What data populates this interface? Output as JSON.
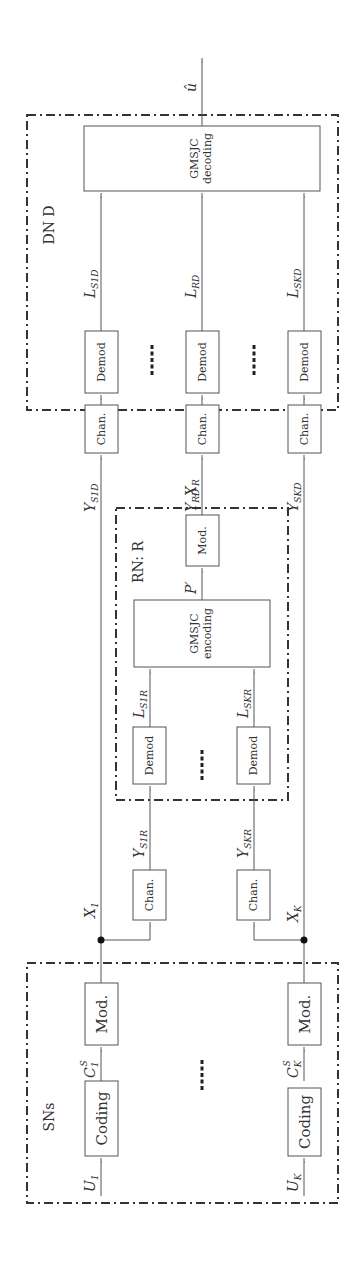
{
  "figure": {
    "orientation": "rotated 90 degrees counter-clockwise",
    "colors": {
      "line": "#555555",
      "group_border": "#333333",
      "text": "#333333",
      "background": "#ffffff"
    }
  },
  "groups": {
    "sns": {
      "label": "SNs"
    },
    "rn": {
      "label": "RN: R"
    },
    "dn": {
      "label": "DN D"
    }
  },
  "blocks": {
    "coding_1": "Coding",
    "mod_1": "Mod.",
    "coding_k": "Coding",
    "mod_k": "Mod.",
    "chan_s1r": "Chan.",
    "chan_skr": "Chan.",
    "demod_s1r": "Demod",
    "demod_skr": "Demod",
    "gmsjc_encoding": {
      "line1": "GMSJC",
      "line2": "encoding"
    },
    "mod_r": "Mod.",
    "chan_s1d": "Chan.",
    "chan_rd": "Chan.",
    "chan_skd": "Chan.",
    "demod_s1d": "Demod",
    "demod_rd": "Demod",
    "demod_skd": "Demod",
    "gmsjc_decoding": {
      "line1": "GMSJC",
      "line2": "decoding"
    }
  },
  "signals": {
    "u1": {
      "main": "U",
      "sub": "1"
    },
    "uk": {
      "main": "U",
      "sub": "K"
    },
    "c1s": {
      "main": "C",
      "sub": "1",
      "sup": "S"
    },
    "cks": {
      "main": "C",
      "sub": "K",
      "sup": "S"
    },
    "x1": {
      "main": "X",
      "sub": "1"
    },
    "xk": {
      "main": "X",
      "sub": "K"
    },
    "y_s1r": {
      "main": "Y",
      "sub": "S1R"
    },
    "y_skr": {
      "main": "Y",
      "sub": "SKR"
    },
    "l_s1r": {
      "main": "L",
      "sub": "S1R"
    },
    "l_skr": {
      "main": "L",
      "sub": "SKR"
    },
    "p_prime": {
      "main": "P′"
    },
    "xr": {
      "main": "X",
      "sub": "R"
    },
    "y_s1d": {
      "main": "Y",
      "sub": "S1D"
    },
    "y_rd": {
      "main": "Y",
      "sub": "RD"
    },
    "y_skd": {
      "main": "Y",
      "sub": "SKD"
    },
    "l_s1d": {
      "main": "L",
      "sub": "S1D"
    },
    "l_rd": {
      "main": "L",
      "sub": "RD"
    },
    "l_skd": {
      "main": "L",
      "sub": "SKD"
    },
    "u_hat": {
      "main": "û"
    }
  },
  "ellipsis": "····"
}
